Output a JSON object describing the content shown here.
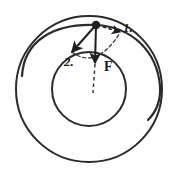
{
  "figure": {
    "type": "physics-orbit-diagram",
    "background_color": "#fefefe",
    "stroke_color": "#2b2b2b"
  },
  "geometry": {
    "center": {
      "x": 89,
      "y": 89
    },
    "outer_circle": {
      "cx": 89,
      "cy": 89,
      "r": 73,
      "stroke_width": 2.0,
      "label": "outer-orbit"
    },
    "inner_circle": {
      "cx": 89,
      "cy": 89,
      "r": 37,
      "stroke_width": 2.0,
      "label": "inner-orbit"
    },
    "transfer_ellipse": {
      "cx": 89,
      "cy": 60,
      "rx": 73,
      "ry": 39,
      "rotation": 0,
      "stroke_width": 2.2,
      "label": "transfer-orbit-arc"
    },
    "body_point": {
      "x": 96,
      "y": 25,
      "r": 4.2,
      "label": "orbiting-body"
    }
  },
  "vectors": [
    {
      "id": "vector-1",
      "label": "1.",
      "style": "dashed",
      "from": {
        "x": 96,
        "y": 25
      },
      "to": {
        "x": 121,
        "y": 32
      },
      "description": "dashed arrow pointing up-right, tangential direction"
    },
    {
      "id": "vector-2",
      "label": "2.",
      "style": "solid",
      "from": {
        "x": 96,
        "y": 25
      },
      "to": {
        "x": 71,
        "y": 53
      },
      "description": "solid arrow pointing down-left"
    },
    {
      "id": "vector-F",
      "label": "F",
      "style": "solid",
      "from": {
        "x": 96,
        "y": 25
      },
      "to": {
        "x": 95,
        "y": 62
      },
      "description": "solid force arrow pointing downward toward center"
    }
  ],
  "dashed_guides": [
    {
      "id": "center-line",
      "from": {
        "x": 95,
        "y": 62
      },
      "to": {
        "x": 93,
        "y": 92
      },
      "description": "dashed continuation of F toward the center"
    },
    {
      "id": "component-arc",
      "description": "dashed arc joining the tips of vectors 1 and 2 through the F tip"
    }
  ],
  "labels": {
    "one": "1.",
    "two": "2.",
    "force": "F"
  }
}
